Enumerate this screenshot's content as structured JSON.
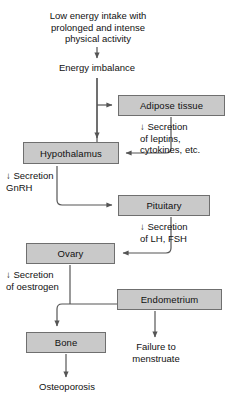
{
  "diagram": {
    "colors": {
      "box_fill": "#c9c9c9",
      "box_border": "#6f6f6f",
      "line": "#555555",
      "text": "#111111",
      "background": "#ffffff"
    },
    "nodes": {
      "low_energy_intake": "Low energy intake with\nprolonged and intense\nphysical activity",
      "energy_imbalance": "Energy imbalance",
      "adipose_tissue": "Adipose tissue",
      "hypothalamus": "Hypothalamus",
      "pituitary": "Pituitary",
      "ovary": "Ovary",
      "endometrium": "Endometrium",
      "bone": "Bone",
      "failure_to_menstruate": "Failure to\nmenstruate",
      "osteoporosis": "Osteoporosis"
    },
    "edge_labels": {
      "leptins_cytokines": "↓ Secretion\nof leptins,\ncytokines, etc.",
      "gnrh": "↓ Secretion\nGnRH",
      "lh_fsh": "↓ Secretion\nof LH, FSH",
      "oestrogen": "↓ Secretion\nof oestrogen"
    }
  }
}
